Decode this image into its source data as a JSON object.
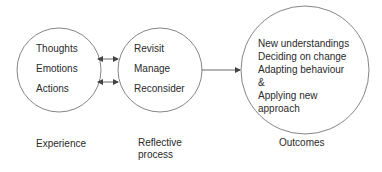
{
  "diagram": {
    "nodes": [
      {
        "id": "experience",
        "items": [
          "Thoughts",
          "Emotions",
          "Actions"
        ],
        "caption": "Experience"
      },
      {
        "id": "reflective-process",
        "items": [
          "Revisit",
          "Manage",
          "Reconsider"
        ],
        "caption_line1": "Reflective",
        "caption_line2": "process"
      },
      {
        "id": "outcomes",
        "items": [
          "New understandings",
          "Deciding on change",
          "Adapting behaviour",
          "&",
          "Applying new",
          "approach"
        ],
        "caption": "Outcomes"
      }
    ],
    "edges": [
      {
        "from": "experience",
        "to": "reflective-process",
        "type": "bidirectional"
      },
      {
        "from": "reflective-process",
        "to": "experience",
        "type": "bidirectional"
      },
      {
        "from": "reflective-process",
        "to": "outcomes",
        "type": "directed"
      }
    ],
    "colors": {
      "stroke": "#555555",
      "text": "#2a2a2a",
      "background": "#ffffff"
    }
  }
}
